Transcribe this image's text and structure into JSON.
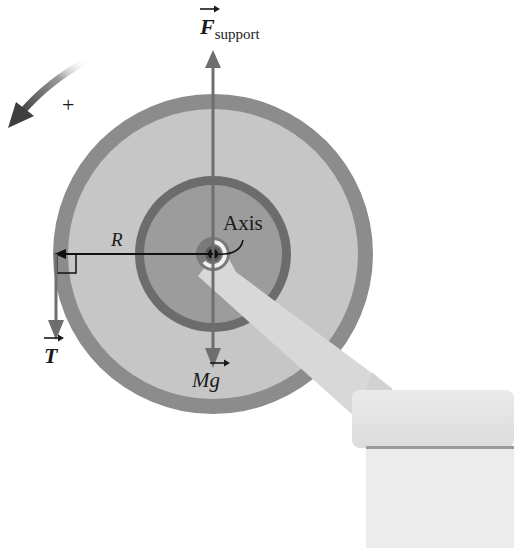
{
  "labels": {
    "f_support_main": "F",
    "f_support_sub": "support",
    "axis": "Axis",
    "radius": "R",
    "tension": "T",
    "weight_M": "M",
    "weight_g": "g",
    "positive_sign": "+"
  },
  "colors": {
    "outer_rim": "#8a8a8a",
    "outer_disk": "#c4c4c4",
    "inner_ring": "#6a6a6a",
    "inner_disk": "#9a9a9a",
    "hub_ring": "#7a7a7a",
    "hub_white": "#f2f2f2",
    "center_dot": "#111111",
    "arm": "#d6d6d6",
    "table_top": "#e2e2e2",
    "table_body": "#ececec",
    "table_shadow": "#9c9c9c",
    "force_arrow": "#6e6e6e",
    "radius_line": "#111111",
    "rotation_arrow": "#555555"
  },
  "geometry": {
    "center": [
      213,
      254
    ],
    "outer_radius": 160,
    "rim_width": 15,
    "inner_ring_radius": 78,
    "inner_ring_width": 9,
    "hub_radius": 17
  }
}
